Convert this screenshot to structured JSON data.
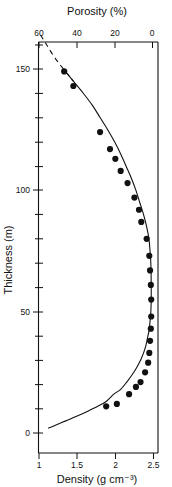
{
  "figure": {
    "caption_top": "Porosity (%)",
    "caption_bottom": "Density (g cm⁻³)",
    "caption_left": "Thickness (m)"
  },
  "chart_data": {
    "type": "line",
    "title": "",
    "subtitle": "",
    "xlabel": "Density (g cm⁻³)",
    "ylabel": "Thickness (m)",
    "x2label": "Porosity (%)",
    "xlim": [
      1,
      2.65
    ],
    "ylim": [
      0,
      165
    ],
    "x2lim": [
      60,
      -4
    ],
    "grid": false,
    "legend": null,
    "legend_position": "none",
    "xticks": [
      1,
      1.5,
      2,
      2.5
    ],
    "xtick_labels": [
      "1",
      "1.5",
      "2",
      "2.5"
    ],
    "x2ticks": [
      60,
      40,
      20,
      0
    ],
    "x2tick_labels": [
      "60",
      "40",
      "20",
      "0"
    ],
    "yticks": [
      0,
      50,
      100,
      150
    ],
    "ytick_labels": [
      "0",
      "50",
      "100",
      "150"
    ],
    "yticks_minor": [
      10,
      20,
      30,
      40,
      60,
      70,
      80,
      90,
      110,
      120,
      130,
      140,
      160
    ],
    "annotations": [
      {
        "text": "upper portion of fitted curve shown dashed (extrapolated, no data)",
        "visual": "dashed-line-segment"
      }
    ],
    "series": [
      {
        "name": "fitted curve",
        "style": "solid-with-dashed-extrapolation",
        "x": [
          1.02,
          1.1,
          1.2,
          1.32,
          1.45,
          1.58,
          1.7,
          1.8,
          1.9,
          1.99,
          2.07,
          2.14,
          2.21,
          2.27,
          2.32,
          2.37,
          2.41,
          2.44,
          2.455,
          2.465,
          2.47,
          2.47,
          2.465,
          2.455,
          2.44,
          2.42,
          2.4,
          2.37,
          2.33,
          2.28,
          2.22,
          2.15,
          2.07,
          1.98,
          1.88,
          1.77,
          1.64,
          1.5,
          1.35,
          1.2,
          1.12
        ],
        "y": [
          164,
          160,
          155,
          150,
          145,
          140,
          135,
          130,
          125,
          120,
          115,
          110,
          105,
          100,
          95,
          90,
          85,
          80,
          75,
          70,
          62,
          55,
          50,
          46,
          42,
          39,
          36,
          33,
          30,
          27,
          24,
          21,
          18,
          16,
          13,
          11,
          9,
          7,
          5,
          3,
          2
        ]
      },
      {
        "name": "measured samples",
        "style": "filled-circles",
        "x": [
          1.33,
          1.45,
          1.8,
          1.93,
          2.0,
          2.07,
          2.16,
          2.25,
          2.31,
          2.34,
          2.41,
          2.445,
          2.455,
          2.465,
          2.47,
          2.47,
          2.465,
          2.455,
          2.445,
          2.43,
          2.39,
          2.33,
          2.27,
          2.18,
          2.02,
          1.88
        ],
        "y": [
          149,
          143,
          124,
          117,
          113,
          108,
          103,
          97,
          92,
          87,
          80,
          73,
          67,
          61,
          55,
          48,
          43,
          38,
          33,
          29,
          25,
          21,
          19,
          16,
          12,
          11
        ]
      }
    ]
  }
}
